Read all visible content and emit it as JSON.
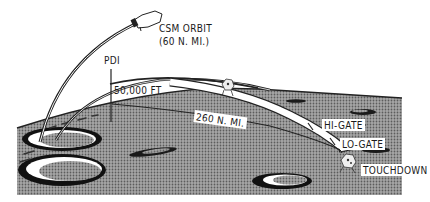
{
  "diagram": {
    "type": "lunar-descent-trajectory",
    "labels": {
      "csm_orbit_line1": "CSM ORBIT",
      "csm_orbit_line2": "(60 N. MI.)",
      "pdi": "PDI",
      "altitude": "50,000 FT",
      "range": "260 N. MI.",
      "hi_gate": "HI-GATE",
      "lo_gate": "LO-GATE",
      "touchdown": "TOUCHDOWN"
    },
    "elements": [
      {
        "name": "csm-orbit-arc",
        "description": "Command/Service Module orbit path"
      },
      {
        "name": "csm-spacecraft",
        "description": "Command/Service Module"
      },
      {
        "name": "lm-transfer-arc",
        "description": "LM descent orbit to PDI"
      },
      {
        "name": "pdi-marker",
        "description": "Powered Descent Initiation vertical marker"
      },
      {
        "name": "powered-descent-path",
        "description": "Braking/approach trajectory band"
      },
      {
        "name": "lunar-module-midcourse",
        "description": "LM during braking phase"
      },
      {
        "name": "lunar-module-touchdown",
        "description": "LM at touchdown"
      },
      {
        "name": "lunar-surface",
        "description": "Cratered lunar surface"
      }
    ],
    "colors": {
      "ink": "#1a1a1a",
      "surface": "#8f8f8f",
      "surface_dark": "#5a5a5a",
      "background": "#ffffff"
    }
  }
}
